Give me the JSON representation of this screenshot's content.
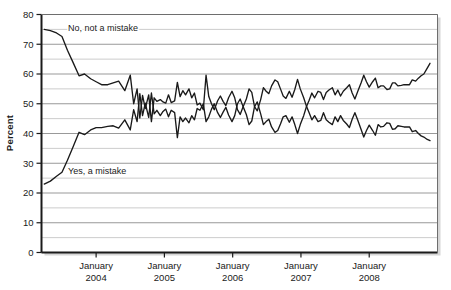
{
  "chart_data": {
    "type": "line",
    "title": "",
    "subtitle": "",
    "xlabel": "",
    "ylabel": "Percent",
    "ylim": [
      0,
      80
    ],
    "ytick_step": 10,
    "yticks": [
      "0",
      "10",
      "20",
      "30",
      "40",
      "50",
      "60",
      "70",
      "80"
    ],
    "grid": true,
    "grid_minor_step": 5,
    "legend_position": "inline-annotation",
    "xtick_labels": [
      {
        "line1": "January",
        "line2": "2004"
      },
      {
        "line1": "January",
        "line2": "2005"
      },
      {
        "line1": "January",
        "line2": "2006"
      },
      {
        "line1": "January",
        "line2": "2007"
      },
      {
        "line1": "January",
        "line2": "2008"
      }
    ],
    "xlim_years": [
      2003.2,
      2009.0
    ],
    "annotations": [
      {
        "name": "no-not-a-mistake-label",
        "text": "No, not a mistake",
        "x_px": 68,
        "y_px": 31
      },
      {
        "name": "yes-a-mistake-label",
        "text": "Yes, a mistake",
        "x_px": 68,
        "y_px": 174
      }
    ],
    "series": [
      {
        "name": "No, not a mistake",
        "color": "#1a1a1a",
        "points": [
          [
            2003.24,
            75.0
          ],
          [
            2003.33,
            74.6
          ],
          [
            2003.42,
            73.8
          ],
          [
            2003.5,
            72.6
          ],
          [
            2003.58,
            68.0
          ],
          [
            2003.66,
            64.0
          ],
          [
            2003.75,
            59.4
          ],
          [
            2003.83,
            60.0
          ],
          [
            2003.92,
            58.4
          ],
          [
            2004.0,
            57.4
          ],
          [
            2004.08,
            56.4
          ],
          [
            2004.17,
            56.4
          ],
          [
            2004.25,
            57.0
          ],
          [
            2004.33,
            57.6
          ],
          [
            2004.42,
            54.4
          ],
          [
            2004.5,
            59.6
          ],
          [
            2004.55,
            50.0
          ],
          [
            2004.6,
            55.0
          ],
          [
            2004.64,
            45.2
          ],
          [
            2004.68,
            52.8
          ],
          [
            2004.72,
            48.4
          ],
          [
            2004.77,
            53.0
          ],
          [
            2004.81,
            44.0
          ],
          [
            2004.85,
            52.0
          ],
          [
            2004.89,
            50.8
          ],
          [
            2004.94,
            51.4
          ],
          [
            2004.98,
            50.6
          ],
          [
            2005.02,
            50.2
          ],
          [
            2005.06,
            53.0
          ],
          [
            2005.1,
            50.4
          ],
          [
            2005.15,
            51.0
          ],
          [
            2005.19,
            57.2
          ],
          [
            2005.23,
            52.4
          ],
          [
            2005.27,
            54.4
          ],
          [
            2005.31,
            53.0
          ],
          [
            2005.36,
            55.0
          ],
          [
            2005.4,
            52.0
          ],
          [
            2005.44,
            53.6
          ],
          [
            2005.48,
            49.6
          ],
          [
            2005.52,
            50.2
          ],
          [
            2005.57,
            48.0
          ],
          [
            2005.61,
            59.6
          ],
          [
            2005.65,
            52.4
          ],
          [
            2005.69,
            50.0
          ],
          [
            2005.73,
            48.0
          ],
          [
            2005.78,
            51.0
          ],
          [
            2005.82,
            52.6
          ],
          [
            2005.86,
            50.8
          ],
          [
            2005.9,
            49.4
          ],
          [
            2005.94,
            52.0
          ],
          [
            2005.99,
            54.2
          ],
          [
            2006.03,
            52.0
          ],
          [
            2006.07,
            48.0
          ],
          [
            2006.11,
            46.4
          ],
          [
            2006.15,
            48.8
          ],
          [
            2006.2,
            51.6
          ],
          [
            2006.24,
            55.0
          ],
          [
            2006.28,
            53.8
          ],
          [
            2006.32,
            49.0
          ],
          [
            2006.36,
            47.6
          ],
          [
            2006.41,
            51.4
          ],
          [
            2006.45,
            55.4
          ],
          [
            2006.49,
            54.2
          ],
          [
            2006.53,
            53.4
          ],
          [
            2006.57,
            56.0
          ],
          [
            2006.62,
            58.0
          ],
          [
            2006.66,
            57.4
          ],
          [
            2006.7,
            55.0
          ],
          [
            2006.74,
            52.6
          ],
          [
            2006.78,
            51.8
          ],
          [
            2006.83,
            54.2
          ],
          [
            2006.87,
            52.2
          ],
          [
            2006.91,
            54.8
          ],
          [
            2006.95,
            58.2
          ],
          [
            2006.99,
            55.0
          ],
          [
            2007.04,
            52.0
          ],
          [
            2007.08,
            49.2
          ],
          [
            2007.12,
            47.0
          ],
          [
            2007.16,
            44.6
          ],
          [
            2007.2,
            46.0
          ],
          [
            2007.25,
            44.0
          ],
          [
            2007.29,
            44.4
          ],
          [
            2007.33,
            47.0
          ],
          [
            2007.37,
            44.6
          ],
          [
            2007.41,
            43.8
          ],
          [
            2007.46,
            43.0
          ],
          [
            2007.5,
            45.6
          ],
          [
            2007.54,
            44.0
          ],
          [
            2007.58,
            46.0
          ],
          [
            2007.62,
            44.4
          ],
          [
            2007.67,
            43.2
          ],
          [
            2007.71,
            42.0
          ],
          [
            2007.75,
            44.8
          ],
          [
            2007.79,
            47.0
          ],
          [
            2007.83,
            44.6
          ],
          [
            2007.88,
            41.4
          ],
          [
            2007.92,
            38.8
          ],
          [
            2007.96,
            41.0
          ],
          [
            2008.0,
            42.8
          ],
          [
            2008.05,
            41.0
          ],
          [
            2008.09,
            39.4
          ],
          [
            2008.13,
            43.0
          ],
          [
            2008.17,
            42.2
          ],
          [
            2008.21,
            42.4
          ],
          [
            2008.26,
            43.6
          ],
          [
            2008.3,
            43.4
          ],
          [
            2008.34,
            41.4
          ],
          [
            2008.38,
            41.6
          ],
          [
            2008.42,
            42.6
          ],
          [
            2008.47,
            42.4
          ],
          [
            2008.51,
            42.2
          ],
          [
            2008.55,
            42.2
          ],
          [
            2008.59,
            42.2
          ],
          [
            2008.63,
            40.6
          ],
          [
            2008.68,
            41.0
          ],
          [
            2008.72,
            40.0
          ],
          [
            2008.76,
            39.2
          ],
          [
            2008.8,
            38.8
          ],
          [
            2008.85,
            38.0
          ],
          [
            2008.89,
            37.6
          ]
        ]
      },
      {
        "name": "Yes, a mistake",
        "color": "#1a1a1a",
        "points": [
          [
            2003.24,
            23.0
          ],
          [
            2003.33,
            24.0
          ],
          [
            2003.42,
            25.6
          ],
          [
            2003.5,
            27.0
          ],
          [
            2003.58,
            31.0
          ],
          [
            2003.66,
            35.4
          ],
          [
            2003.75,
            40.4
          ],
          [
            2003.83,
            39.6
          ],
          [
            2003.92,
            41.2
          ],
          [
            2004.0,
            42.0
          ],
          [
            2004.08,
            42.0
          ],
          [
            2004.17,
            42.4
          ],
          [
            2004.25,
            42.6
          ],
          [
            2004.33,
            41.8
          ],
          [
            2004.42,
            44.6
          ],
          [
            2004.5,
            41.2
          ],
          [
            2004.55,
            48.0
          ],
          [
            2004.6,
            44.0
          ],
          [
            2004.64,
            53.4
          ],
          [
            2004.68,
            46.0
          ],
          [
            2004.72,
            50.2
          ],
          [
            2004.77,
            45.4
          ],
          [
            2004.81,
            53.6
          ],
          [
            2004.85,
            46.6
          ],
          [
            2004.89,
            47.8
          ],
          [
            2004.94,
            46.0
          ],
          [
            2004.98,
            47.4
          ],
          [
            2005.02,
            48.2
          ],
          [
            2005.06,
            45.6
          ],
          [
            2005.1,
            47.8
          ],
          [
            2005.15,
            47.0
          ],
          [
            2005.19,
            38.6
          ],
          [
            2005.23,
            45.6
          ],
          [
            2005.27,
            44.0
          ],
          [
            2005.31,
            45.2
          ],
          [
            2005.36,
            43.6
          ],
          [
            2005.4,
            46.0
          ],
          [
            2005.44,
            44.6
          ],
          [
            2005.48,
            48.4
          ],
          [
            2005.52,
            47.8
          ],
          [
            2005.57,
            50.0
          ],
          [
            2005.61,
            44.0
          ],
          [
            2005.65,
            45.6
          ],
          [
            2005.69,
            48.2
          ],
          [
            2005.73,
            50.0
          ],
          [
            2005.78,
            47.0
          ],
          [
            2005.82,
            45.4
          ],
          [
            2005.86,
            47.2
          ],
          [
            2005.9,
            48.8
          ],
          [
            2005.94,
            46.2
          ],
          [
            2005.99,
            44.0
          ],
          [
            2006.03,
            46.0
          ],
          [
            2006.07,
            50.0
          ],
          [
            2006.11,
            51.6
          ],
          [
            2006.15,
            49.2
          ],
          [
            2006.2,
            46.4
          ],
          [
            2006.24,
            43.0
          ],
          [
            2006.28,
            44.2
          ],
          [
            2006.32,
            49.0
          ],
          [
            2006.36,
            50.6
          ],
          [
            2006.41,
            46.6
          ],
          [
            2006.45,
            43.0
          ],
          [
            2006.49,
            44.0
          ],
          [
            2006.53,
            44.8
          ],
          [
            2006.57,
            42.2
          ],
          [
            2006.62,
            40.4
          ],
          [
            2006.66,
            41.0
          ],
          [
            2006.7,
            43.2
          ],
          [
            2006.74,
            45.6
          ],
          [
            2006.78,
            46.0
          ],
          [
            2006.83,
            43.8
          ],
          [
            2006.87,
            45.6
          ],
          [
            2006.91,
            43.0
          ],
          [
            2006.95,
            40.0
          ],
          [
            2006.99,
            43.0
          ],
          [
            2007.04,
            46.0
          ],
          [
            2007.08,
            49.0
          ],
          [
            2007.12,
            51.2
          ],
          [
            2007.16,
            53.6
          ],
          [
            2007.2,
            52.0
          ],
          [
            2007.25,
            54.2
          ],
          [
            2007.29,
            53.8
          ],
          [
            2007.33,
            51.4
          ],
          [
            2007.37,
            53.8
          ],
          [
            2007.41,
            54.6
          ],
          [
            2007.46,
            55.4
          ],
          [
            2007.5,
            53.0
          ],
          [
            2007.54,
            54.6
          ],
          [
            2007.58,
            52.6
          ],
          [
            2007.62,
            54.2
          ],
          [
            2007.67,
            55.4
          ],
          [
            2007.71,
            56.4
          ],
          [
            2007.75,
            53.6
          ],
          [
            2007.79,
            51.6
          ],
          [
            2007.83,
            54.0
          ],
          [
            2007.88,
            57.0
          ],
          [
            2007.92,
            59.6
          ],
          [
            2007.96,
            57.4
          ],
          [
            2008.0,
            55.6
          ],
          [
            2008.05,
            57.4
          ],
          [
            2008.09,
            58.6
          ],
          [
            2008.13,
            55.4
          ],
          [
            2008.17,
            56.0
          ],
          [
            2008.21,
            56.0
          ],
          [
            2008.26,
            54.8
          ],
          [
            2008.3,
            55.0
          ],
          [
            2008.34,
            57.0
          ],
          [
            2008.38,
            57.0
          ],
          [
            2008.42,
            56.0
          ],
          [
            2008.47,
            56.2
          ],
          [
            2008.51,
            56.4
          ],
          [
            2008.55,
            56.4
          ],
          [
            2008.59,
            56.4
          ],
          [
            2008.63,
            58.0
          ],
          [
            2008.68,
            57.6
          ],
          [
            2008.72,
            58.6
          ],
          [
            2008.76,
            59.4
          ],
          [
            2008.8,
            60.0
          ],
          [
            2008.85,
            62.0
          ],
          [
            2008.89,
            63.6
          ]
        ]
      }
    ]
  },
  "colors": {
    "line": "#1a1a1a",
    "grid_major": "#999999",
    "grid_minor": "#cccccc",
    "axis": "#1a1a1a",
    "text": "#1a1a1a",
    "background": "#ffffff",
    "shadow": "#bbbbbb"
  }
}
